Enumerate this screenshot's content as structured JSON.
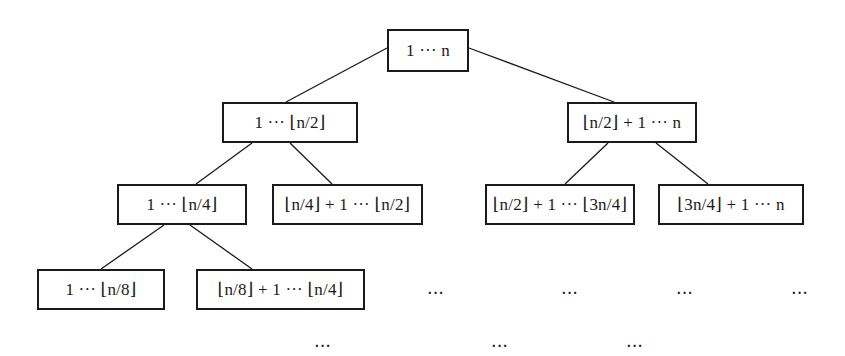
{
  "diagram": {
    "type": "tree",
    "nodes": [
      {
        "id": "root",
        "label": "1 ··· n",
        "level": 0,
        "box": [
          387,
          29,
          82,
          43
        ]
      },
      {
        "id": "l",
        "label": "1 ··· ⌊n/2⌋",
        "level": 1,
        "box": [
          222,
          102,
          136,
          41
        ]
      },
      {
        "id": "r",
        "label": "⌊n/2⌋ + 1 ··· n",
        "level": 1,
        "box": [
          567,
          102,
          130,
          41
        ]
      },
      {
        "id": "ll",
        "label": "1 ··· ⌊n/4⌋",
        "level": 2,
        "box": [
          117,
          184,
          130,
          41
        ]
      },
      {
        "id": "lr",
        "label": "⌊n/4⌋ + 1 ··· ⌊n/2⌋",
        "level": 2,
        "box": [
          272,
          184,
          151,
          41
        ]
      },
      {
        "id": "rl",
        "label": "⌊n/2⌋ + 1 ··· ⌊3n/4⌋",
        "level": 2,
        "box": [
          485,
          184,
          150,
          41
        ]
      },
      {
        "id": "rr",
        "label": "⌊3n/4⌋ + 1 ··· n",
        "level": 2,
        "box": [
          658,
          184,
          146,
          41
        ]
      },
      {
        "id": "lll",
        "label": "1 ··· ⌊n/8⌋",
        "level": 3,
        "box": [
          37,
          269,
          128,
          41
        ]
      },
      {
        "id": "llr",
        "label": "⌊n/8⌋ + 1 ··· ⌊n/4⌋",
        "level": 3,
        "box": [
          196,
          269,
          169,
          41
        ]
      }
    ],
    "edges": [
      {
        "from": "root",
        "to": "l",
        "x1": 387,
        "y1": 48,
        "x2": 286,
        "y2": 102
      },
      {
        "from": "root",
        "to": "r",
        "x1": 469,
        "y1": 48,
        "x2": 614,
        "y2": 102
      },
      {
        "from": "l",
        "to": "ll",
        "x1": 252,
        "y1": 143,
        "x2": 196,
        "y2": 184
      },
      {
        "from": "l",
        "to": "lr",
        "x1": 290,
        "y1": 143,
        "x2": 332,
        "y2": 184
      },
      {
        "from": "r",
        "to": "rl",
        "x1": 608,
        "y1": 143,
        "x2": 565,
        "y2": 184
      },
      {
        "from": "r",
        "to": "rr",
        "x1": 656,
        "y1": 143,
        "x2": 708,
        "y2": 184
      },
      {
        "from": "ll",
        "to": "lll",
        "x1": 164,
        "y1": 225,
        "x2": 101,
        "y2": 269
      },
      {
        "from": "ll",
        "to": "llr",
        "x1": 190,
        "y1": 225,
        "x2": 252,
        "y2": 269
      }
    ],
    "ellipses": [
      {
        "label": "···",
        "x": 436,
        "y": 294
      },
      {
        "label": "···",
        "x": 570,
        "y": 294
      },
      {
        "label": "···",
        "x": 685,
        "y": 294
      },
      {
        "label": "···",
        "x": 800,
        "y": 294
      },
      {
        "label": "···",
        "x": 323,
        "y": 347
      },
      {
        "label": "···",
        "x": 500,
        "y": 347
      },
      {
        "label": "···",
        "x": 635,
        "y": 347
      }
    ],
    "colors": {
      "stroke": "#1a1a1a",
      "background": "#ffffff"
    }
  }
}
